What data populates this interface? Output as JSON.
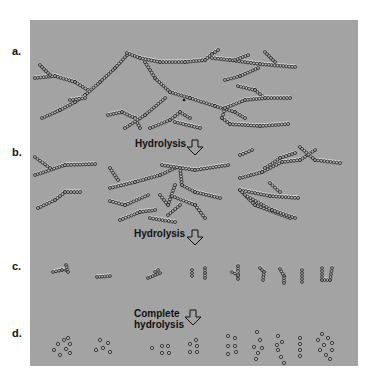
{
  "figure": {
    "panel_color": "#a3a3a3",
    "bead_stroke": "#1a1a1a",
    "bead_fill": "#b8b8b8",
    "highlight": "#f2f2f2",
    "rows": [
      {
        "label": "a.",
        "description": "Highly branched polysaccharide chains"
      },
      {
        "label": "b.",
        "description": "Shorter branched fragments"
      },
      {
        "label": "c.",
        "description": "Small oligosaccharide fragments"
      },
      {
        "label": "d.",
        "description": "Individual monosaccharide units"
      }
    ],
    "steps": [
      {
        "text": "Hydrolysis"
      },
      {
        "text": "Hydrolysis"
      },
      {
        "line1": "Complete",
        "line2": "hydrolysis"
      }
    ]
  }
}
